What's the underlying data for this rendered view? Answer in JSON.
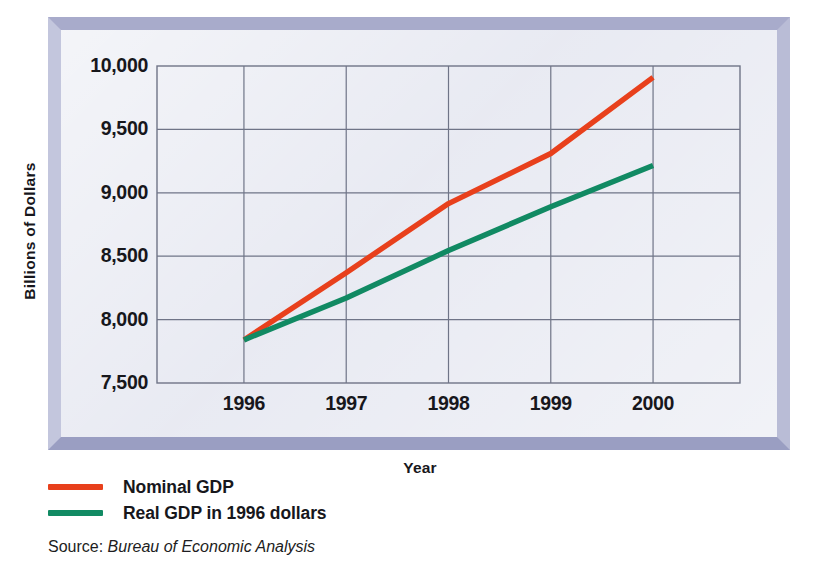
{
  "chart_data": {
    "type": "line",
    "title": "",
    "xlabel": "Year",
    "ylabel": "Billions of Dollars",
    "x": [
      1996,
      1997,
      1998,
      1999,
      2000
    ],
    "xtick_labels": [
      "1996",
      "1997",
      "1998",
      "1999",
      "2000"
    ],
    "ytick_labels": [
      "10,000",
      "9,500",
      "9,000",
      "8,500",
      "8,000",
      "7,500"
    ],
    "ytick_values": [
      10000,
      9500,
      9000,
      8500,
      8000,
      7500
    ],
    "ylim": [
      7500,
      10000
    ],
    "xlim": [
      1995.15,
      2000.85
    ],
    "grid": true,
    "legend_position": "below-plot-left",
    "series": [
      {
        "name": "Nominal GDP",
        "color": "#e8401c",
        "values": [
          7840,
          8370,
          8915,
          9310,
          9910
        ]
      },
      {
        "name": "Real GDP in 1996 dollars",
        "color": "#118a63",
        "values": [
          7840,
          8170,
          8545,
          8890,
          9215
        ]
      }
    ]
  },
  "legend": {
    "items": [
      {
        "label": "Nominal GDP",
        "color": "#e8401c"
      },
      {
        "label": "Real GDP in 1996 dollars",
        "color": "#118a63"
      }
    ]
  },
  "source": {
    "prefix": "Source:",
    "name": "Bureau of Economic Analysis"
  },
  "colors": {
    "nominal": "#e8401c",
    "real": "#118a63",
    "frame_bevel_top": "#a8abcb",
    "frame_bevel_bottom": "#9a9ec2",
    "plot_background": "#e6e8f1",
    "gridline": "#6f7487",
    "text": "#17171c"
  }
}
